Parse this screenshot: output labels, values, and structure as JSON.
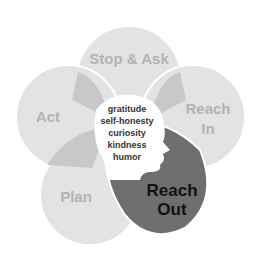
{
  "diagram": {
    "petals": [
      {
        "label": "Stop & Ask"
      },
      {
        "label_line1": "Reach",
        "label_line2": "In"
      },
      {
        "label_line1": "Reach",
        "label_line2": "Out"
      },
      {
        "label": "Plan"
      },
      {
        "label": "Act"
      }
    ],
    "center": {
      "icon": "head-silhouette-icon",
      "values": [
        "gratitude",
        "self-honesty",
        "curiosity",
        "kindness",
        "humor"
      ]
    },
    "highlighted": "Reach Out",
    "colors": {
      "petal": "#e3e3e3",
      "overlap": "#c8c8c8",
      "highlight": "#6e6e6e",
      "label_muted": "#b3b3b3",
      "label_dark": "#111111"
    }
  }
}
